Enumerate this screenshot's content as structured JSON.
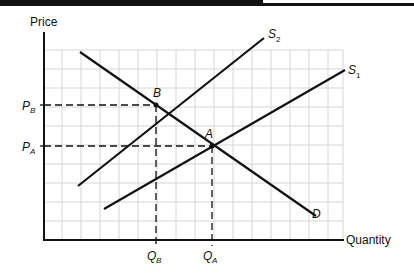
{
  "diagram": {
    "axes": {
      "y_label": "Price",
      "x_label": "Quantity"
    },
    "curves": {
      "demand": {
        "label": "D",
        "from": [
          80,
          52
        ],
        "to": [
          316,
          216
        ]
      },
      "supply_1": {
        "label": "S",
        "sub": "1",
        "from": [
          104,
          209
        ],
        "to": [
          345,
          70
        ]
      },
      "supply_2": {
        "label": "S",
        "sub": "2",
        "from": [
          78,
          186
        ],
        "to": [
          264,
          38
        ]
      }
    },
    "points": {
      "A": {
        "label": "A",
        "x": 212,
        "y": 146
      },
      "B": {
        "label": "B",
        "x": 156,
        "y": 105
      }
    },
    "ticks": {
      "P_B": {
        "label": "P",
        "sub": "B"
      },
      "P_A": {
        "label": "P",
        "sub": "A"
      },
      "Q_B": {
        "label": "Q",
        "sub": "B"
      },
      "Q_A": {
        "label": "Q",
        "sub": "A"
      }
    },
    "colors": {
      "line": "#111111",
      "grid": "#d4d4d4",
      "background": "#ffffff"
    }
  }
}
